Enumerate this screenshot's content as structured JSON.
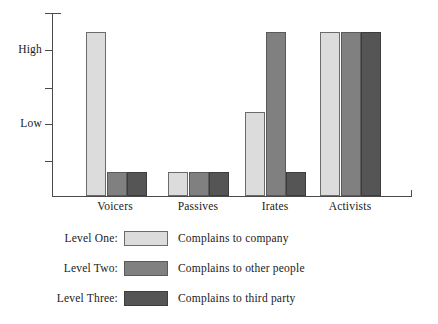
{
  "chart_data": {
    "type": "bar",
    "title": "",
    "xlabel": "",
    "ylabel": "",
    "grid": false,
    "legend_position": "below",
    "categories": [
      "Voicers",
      "Passives",
      "Irates",
      "Activists"
    ],
    "y_tick_labels": [
      "High",
      "Low"
    ],
    "ylim": [
      0,
      5
    ],
    "y_axis_ticks": 5,
    "series": [
      {
        "name": "Level One",
        "description": "Complains to company",
        "color": "#dcdcdc",
        "values": [
          4.7,
          0.7,
          2.4,
          4.7
        ]
      },
      {
        "name": "Level Two",
        "description": "Complains to other people",
        "color": "#808080",
        "values": [
          0.7,
          0.7,
          4.7,
          4.7
        ]
      },
      {
        "name": "Level Three",
        "description": "Complains to third party",
        "color": "#555555",
        "values": [
          0.7,
          0.7,
          0.7,
          4.7
        ]
      }
    ]
  },
  "axis": {
    "y_labels": [
      {
        "text": "High",
        "tick_index": 1
      },
      {
        "text": "Low",
        "tick_index": 3
      }
    ]
  },
  "legend": {
    "rows": [
      {
        "key": "Level One:",
        "desc": "Complains to company",
        "color": "#dcdcdc"
      },
      {
        "key": "Level Two:",
        "desc": "Complains to other people",
        "color": "#808080"
      },
      {
        "key": "Level Three:",
        "desc": "Complains to third party",
        "color": "#555555"
      }
    ]
  }
}
